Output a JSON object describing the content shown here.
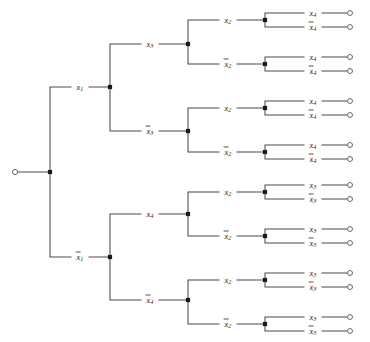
{
  "figure": {
    "type": "binary-decision-tree",
    "title": "",
    "background_color": "#ffffff",
    "line_color": "#4a4a4a",
    "node_color": "#1a1a1a",
    "terminal_stroke": "#5a5a5a",
    "width": 370,
    "height": 342,
    "depth": 4,
    "terminal_count": 16
  },
  "root": {
    "name": "root-terminal",
    "cx": 15,
    "cy": 172,
    "r": 2.6
  },
  "junctions": [
    {
      "name": "junction-root",
      "x": 50,
      "y": 172,
      "level": 0
    },
    {
      "name": "junction-x1",
      "x": 110,
      "y": 87,
      "level": 1
    },
    {
      "name": "junction-x1-bar",
      "x": 110,
      "y": 257,
      "level": 1
    },
    {
      "name": "junction-x3",
      "x": 188,
      "y": 44,
      "level": 2
    },
    {
      "name": "junction-x3-bar",
      "x": 188,
      "y": 131,
      "level": 2
    },
    {
      "name": "junction-x4",
      "x": 188,
      "y": 214,
      "level": 2
    },
    {
      "name": "junction-x4-bar",
      "x": 188,
      "y": 300,
      "level": 2
    },
    {
      "name": "junction-x2-a",
      "x": 265,
      "y": 20,
      "level": 3
    },
    {
      "name": "junction-x2-bar-a",
      "x": 265,
      "y": 64,
      "level": 3
    },
    {
      "name": "junction-x2-b",
      "x": 265,
      "y": 108,
      "level": 3
    },
    {
      "name": "junction-x2-bar-b",
      "x": 265,
      "y": 152,
      "level": 3
    },
    {
      "name": "junction-x2-c",
      "x": 265,
      "y": 192,
      "level": 3
    },
    {
      "name": "junction-x2-bar-c",
      "x": 265,
      "y": 236,
      "level": 3
    },
    {
      "name": "junction-x2-d",
      "x": 265,
      "y": 280,
      "level": 3
    },
    {
      "name": "junction-x2-bar-d",
      "x": 265,
      "y": 324,
      "level": 3
    }
  ],
  "edges": [
    {
      "name": "edge-root-stem",
      "path": "M 17.6 172 L 50 172"
    },
    {
      "name": "edge-root-to-x1",
      "path": "M 50 172 L 50 87 L 110 87"
    },
    {
      "name": "edge-root-to-x1-bar",
      "path": "M 50 172 L 50 257 L 110 257"
    },
    {
      "name": "edge-x1-to-x3",
      "path": "M 110 87 L 110 44 L 188 44"
    },
    {
      "name": "edge-x1-to-x3-bar",
      "path": "M 110 87 L 110 131 L 188 131"
    },
    {
      "name": "edge-x1bar-to-x4",
      "path": "M 110 257 L 110 214 L 188 214"
    },
    {
      "name": "edge-x1bar-to-x4-bar",
      "path": "M 110 257 L 110 300 L 188 300"
    },
    {
      "name": "edge-x3-to-x2a",
      "path": "M 188 44 L 188 20 L 265 20"
    },
    {
      "name": "edge-x3-to-x2bar-a",
      "path": "M 188 44 L 188 64 L 265 64"
    },
    {
      "name": "edge-x3bar-to-x2b",
      "path": "M 188 131 L 188 108 L 265 108"
    },
    {
      "name": "edge-x3bar-to-x2bar-b",
      "path": "M 188 131 L 188 152 L 265 152"
    },
    {
      "name": "edge-x4-to-x2c",
      "path": "M 188 214 L 188 192 L 265 192"
    },
    {
      "name": "edge-x4-to-x2bar-c",
      "path": "M 188 214 L 188 236 L 265 236"
    },
    {
      "name": "edge-x4bar-to-x2d",
      "path": "M 188 300 L 188 280 L 265 280"
    },
    {
      "name": "edge-x4bar-to-x2bar-d",
      "path": "M 188 300 L 188 324 L 265 324"
    },
    {
      "name": "edge-leaf-1",
      "path": "M 265 20  L 265 13  L 347 13"
    },
    {
      "name": "edge-leaf-2",
      "path": "M 265 20  L 265 27  L 347 27"
    },
    {
      "name": "edge-leaf-3",
      "path": "M 265 64  L 265 57  L 347 57"
    },
    {
      "name": "edge-leaf-4",
      "path": "M 265 64  L 265 71  L 347 71"
    },
    {
      "name": "edge-leaf-5",
      "path": "M 265 108 L 265 101 L 347 101"
    },
    {
      "name": "edge-leaf-6",
      "path": "M 265 108 L 265 115 L 347 115"
    },
    {
      "name": "edge-leaf-7",
      "path": "M 265 152 L 265 145 L 347 145"
    },
    {
      "name": "edge-leaf-8",
      "path": "M 265 152 L 265 159 L 347 159"
    },
    {
      "name": "edge-leaf-9",
      "path": "M 265 192 L 265 185 L 347 185"
    },
    {
      "name": "edge-leaf-10",
      "path": "M 265 192 L 265 199 L 347 199"
    },
    {
      "name": "edge-leaf-11",
      "path": "M 265 236 L 265 229 L 347 229"
    },
    {
      "name": "edge-leaf-12",
      "path": "M 265 236 L 265 243 L 347 243"
    },
    {
      "name": "edge-leaf-13",
      "path": "M 265 280 L 265 273 L 347 273"
    },
    {
      "name": "edge-leaf-14",
      "path": "M 265 280 L 265 287 L 347 287"
    },
    {
      "name": "edge-leaf-15",
      "path": "M 265 324 L 265 317 L 347 317"
    },
    {
      "name": "edge-leaf-16",
      "path": "M 265 324 L 265 331 L 347 331"
    }
  ],
  "edge_labels": [
    {
      "name": "label-x1",
      "var": "x",
      "sub": "1",
      "negated": false,
      "x": 80,
      "y": 87
    },
    {
      "name": "label-x1-bar",
      "var": "x",
      "sub": "1",
      "negated": true,
      "x": 80,
      "y": 257
    },
    {
      "name": "label-x3",
      "var": "x",
      "sub": "3",
      "negated": false,
      "x": 150,
      "y": 44
    },
    {
      "name": "label-x3-bar",
      "var": "x",
      "sub": "3",
      "negated": true,
      "x": 150,
      "y": 131
    },
    {
      "name": "label-x4",
      "var": "x",
      "sub": "4",
      "negated": false,
      "x": 150,
      "y": 214
    },
    {
      "name": "label-x4-bar",
      "var": "x",
      "sub": "4",
      "negated": true,
      "x": 150,
      "y": 300
    },
    {
      "name": "label-x2-a",
      "var": "x",
      "sub": "2",
      "negated": false,
      "x": 228,
      "y": 20
    },
    {
      "name": "label-x2-bar-a",
      "var": "x",
      "sub": "2",
      "negated": true,
      "x": 228,
      "y": 64
    },
    {
      "name": "label-x2-b",
      "var": "x",
      "sub": "2",
      "negated": false,
      "x": 228,
      "y": 108
    },
    {
      "name": "label-x2-bar-b",
      "var": "x",
      "sub": "2",
      "negated": true,
      "x": 228,
      "y": 152
    },
    {
      "name": "label-x2-c",
      "var": "x",
      "sub": "2",
      "negated": false,
      "x": 228,
      "y": 192
    },
    {
      "name": "label-x2-bar-c",
      "var": "x",
      "sub": "2",
      "negated": true,
      "x": 228,
      "y": 236
    },
    {
      "name": "label-x2-d",
      "var": "x",
      "sub": "2",
      "negated": false,
      "x": 228,
      "y": 280
    },
    {
      "name": "label-x2-bar-d",
      "var": "x",
      "sub": "2",
      "negated": true,
      "x": 228,
      "y": 324
    }
  ],
  "leaf_labels": [
    {
      "name": "leaf-label-1",
      "var": "x",
      "sub": "4",
      "negated": false,
      "x": 313,
      "y": 13
    },
    {
      "name": "leaf-label-2",
      "var": "x",
      "sub": "4",
      "negated": true,
      "x": 313,
      "y": 27
    },
    {
      "name": "leaf-label-3",
      "var": "x",
      "sub": "4",
      "negated": false,
      "x": 313,
      "y": 57
    },
    {
      "name": "leaf-label-4",
      "var": "x",
      "sub": "4",
      "negated": true,
      "x": 313,
      "y": 71
    },
    {
      "name": "leaf-label-5",
      "var": "x",
      "sub": "4",
      "negated": false,
      "x": 313,
      "y": 101
    },
    {
      "name": "leaf-label-6",
      "var": "x",
      "sub": "4",
      "negated": true,
      "x": 313,
      "y": 115
    },
    {
      "name": "leaf-label-7",
      "var": "x",
      "sub": "4",
      "negated": false,
      "x": 313,
      "y": 145
    },
    {
      "name": "leaf-label-8",
      "var": "x",
      "sub": "4",
      "negated": true,
      "x": 313,
      "y": 159
    },
    {
      "name": "leaf-label-9",
      "var": "x",
      "sub": "3",
      "negated": false,
      "x": 313,
      "y": 185
    },
    {
      "name": "leaf-label-10",
      "var": "x",
      "sub": "3",
      "negated": true,
      "x": 313,
      "y": 199
    },
    {
      "name": "leaf-label-11",
      "var": "x",
      "sub": "3",
      "negated": false,
      "x": 313,
      "y": 229
    },
    {
      "name": "leaf-label-12",
      "var": "x",
      "sub": "3",
      "negated": true,
      "x": 313,
      "y": 243
    },
    {
      "name": "leaf-label-13",
      "var": "x",
      "sub": "3",
      "negated": false,
      "x": 313,
      "y": 273
    },
    {
      "name": "leaf-label-14",
      "var": "x",
      "sub": "3",
      "negated": true,
      "x": 313,
      "y": 287
    },
    {
      "name": "leaf-label-15",
      "var": "x",
      "sub": "3",
      "negated": false,
      "x": 313,
      "y": 317
    },
    {
      "name": "leaf-label-16",
      "var": "x",
      "sub": "3",
      "negated": true,
      "x": 313,
      "y": 331
    }
  ],
  "terminals": [
    {
      "name": "terminal-node-1",
      "cx": 350,
      "cy": 13,
      "r": 2.5
    },
    {
      "name": "terminal-node-2",
      "cx": 350,
      "cy": 27,
      "r": 2.5
    },
    {
      "name": "terminal-node-3",
      "cx": 350,
      "cy": 57,
      "r": 2.5
    },
    {
      "name": "terminal-node-4",
      "cx": 350,
      "cy": 71,
      "r": 2.5
    },
    {
      "name": "terminal-node-5",
      "cx": 350,
      "cy": 101,
      "r": 2.5
    },
    {
      "name": "terminal-node-6",
      "cx": 350,
      "cy": 115,
      "r": 2.5
    },
    {
      "name": "terminal-node-7",
      "cx": 350,
      "cy": 145,
      "r": 2.5
    },
    {
      "name": "terminal-node-8",
      "cx": 350,
      "cy": 159,
      "r": 2.5
    },
    {
      "name": "terminal-node-9",
      "cx": 350,
      "cy": 185,
      "r": 2.5
    },
    {
      "name": "terminal-node-10",
      "cx": 350,
      "cy": 199,
      "r": 2.5
    },
    {
      "name": "terminal-node-11",
      "cx": 350,
      "cy": 229,
      "r": 2.5
    },
    {
      "name": "terminal-node-12",
      "cx": 350,
      "cy": 243,
      "r": 2.5
    },
    {
      "name": "terminal-node-13",
      "cx": 350,
      "cy": 273,
      "r": 2.5
    },
    {
      "name": "terminal-node-14",
      "cx": 350,
      "cy": 287,
      "r": 2.5
    },
    {
      "name": "terminal-node-15",
      "cx": 350,
      "cy": 317,
      "r": 2.5
    },
    {
      "name": "terminal-node-16",
      "cx": 350,
      "cy": 331,
      "r": 2.5
    }
  ]
}
